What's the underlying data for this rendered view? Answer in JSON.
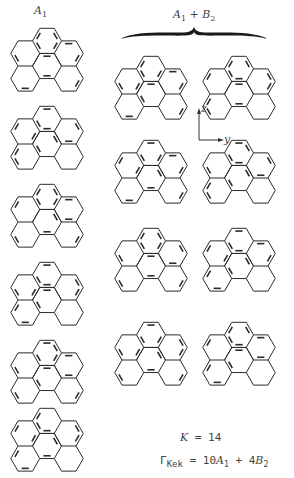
{
  "header": {
    "left_label": "A",
    "left_label_sub": "1",
    "right_label_a": "A",
    "right_label_a_sub": "1",
    "right_label_plus": " + ",
    "right_label_b": "B",
    "right_label_b_sub": "2"
  },
  "axes": {
    "z": "z",
    "y": "y"
  },
  "footer": {
    "k_label": "K",
    "k_eq": " = 14",
    "gamma": "Γ",
    "gamma_sub": "Kek",
    "gamma_eq": " = 10",
    "a": "A",
    "a_sub": "1",
    "plus": " + 4",
    "b": "B",
    "b_sub": "2"
  },
  "molecule": {
    "name": "benzo[ghi]perylene",
    "rings": [
      "top",
      "upper-left",
      "upper-right",
      "center",
      "lower-left",
      "lower-right"
    ],
    "line_color": "#2b2b2b"
  },
  "structures": [
    {
      "column": "A1",
      "x": 4,
      "y": 22,
      "doubles": [
        0,
        3,
        5,
        8,
        11,
        14,
        17,
        20,
        23,
        26,
        2
      ]
    },
    {
      "column": "A1",
      "x": 4,
      "y": 100,
      "doubles": [
        1,
        4,
        6,
        9,
        12,
        15,
        18,
        21,
        24,
        25,
        2
      ]
    },
    {
      "column": "A1",
      "x": 4,
      "y": 178,
      "doubles": [
        0,
        3,
        5,
        9,
        12,
        14,
        17,
        21,
        24,
        26,
        2
      ]
    },
    {
      "column": "A1",
      "x": 4,
      "y": 256,
      "doubles": [
        1,
        4,
        6,
        8,
        11,
        15,
        18,
        20,
        23,
        25,
        2
      ]
    },
    {
      "column": "A1",
      "x": 4,
      "y": 334,
      "doubles": [
        0,
        4,
        5,
        8,
        12,
        14,
        18,
        20,
        24,
        26,
        2
      ]
    },
    {
      "column": "A1",
      "x": 4,
      "y": 402,
      "doubles": [
        1,
        3,
        6,
        9,
        11,
        15,
        17,
        21,
        23,
        25,
        2
      ]
    },
    {
      "column": "A1+B2",
      "x": 108,
      "y": 50,
      "doubles": [
        0,
        3,
        6,
        8,
        11,
        14,
        18,
        20,
        23,
        26,
        2
      ]
    },
    {
      "column": "A1+B2",
      "x": 196,
      "y": 50,
      "doubles": [
        1,
        3,
        5,
        9,
        11,
        15,
        17,
        20,
        24,
        25,
        2
      ]
    },
    {
      "column": "A1+B2",
      "x": 108,
      "y": 134,
      "doubles": [
        0,
        4,
        6,
        9,
        11,
        14,
        17,
        21,
        23,
        26,
        2
      ]
    },
    {
      "column": "A1+B2",
      "x": 196,
      "y": 134,
      "doubles": [
        1,
        4,
        5,
        8,
        12,
        15,
        18,
        21,
        24,
        25,
        2
      ]
    },
    {
      "column": "A1+B2",
      "x": 108,
      "y": 222,
      "doubles": [
        0,
        3,
        5,
        8,
        12,
        15,
        17,
        20,
        24,
        26,
        2
      ]
    },
    {
      "column": "A1+B2",
      "x": 196,
      "y": 222,
      "doubles": [
        1,
        4,
        6,
        9,
        11,
        14,
        18,
        21,
        23,
        25,
        2
      ]
    },
    {
      "column": "A1+B2",
      "x": 108,
      "y": 316,
      "doubles": [
        0,
        4,
        6,
        8,
        11,
        15,
        17,
        21,
        24,
        26,
        2
      ]
    },
    {
      "column": "A1+B2",
      "x": 196,
      "y": 316,
      "doubles": [
        1,
        3,
        5,
        9,
        12,
        14,
        18,
        20,
        23,
        25,
        2
      ]
    }
  ]
}
